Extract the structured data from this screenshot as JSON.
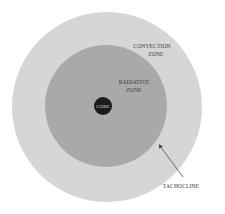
{
  "diagram": {
    "colors": {
      "background": "#ffffff",
      "convection_zone": "#d6d6d6",
      "radiative_zone": "#a9a9a9",
      "core": "#1c1c1c",
      "arrow": "#3a3a3a",
      "text": "#3a3a3a"
    },
    "layers": [
      {
        "id": "convection",
        "label_line1": "CONVECTION",
        "label_line2": "ZONE"
      },
      {
        "id": "radiative",
        "label_line1": "RADIATIVE",
        "label_line2": "ZONE"
      },
      {
        "id": "core",
        "label": "CORE"
      }
    ],
    "annotations": [
      {
        "id": "tachocline",
        "label": "TACHOCLINE"
      }
    ]
  }
}
